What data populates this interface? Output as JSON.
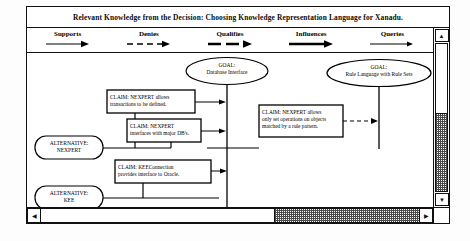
{
  "window": {
    "title": "Relevant Knowledge from the Decision: Choosing Knowledge Representation Language for Xanadu."
  },
  "legend": {
    "items": [
      {
        "label": "Supports",
        "style": "thin-solid-arrow",
        "icon": "arrow-right-icon"
      },
      {
        "label": "Denies",
        "style": "thin-dashed-arrow",
        "icon": "arrow-right-dashed-icon"
      },
      {
        "label": "Qualifies",
        "style": "thick-dashed-arrow",
        "icon": "arrow-right-thick-dashed-icon"
      },
      {
        "label": "Influences",
        "style": "thick-solid-arrow",
        "icon": "arrow-right-thick-icon"
      },
      {
        "label": "Queries",
        "style": "thin-solid-arrow",
        "icon": "arrow-right-small-icon"
      }
    ]
  },
  "graph": {
    "goals": [
      {
        "id": "goal-database-interface",
        "line1": "GOAL:",
        "line2": "Database Interface"
      },
      {
        "id": "goal-rule-language",
        "line1": "GOAL:",
        "line2": "Rule Language with Rule Sets"
      }
    ],
    "alternatives": [
      {
        "id": "alternative-nexpert",
        "line1": "ALTERNATIVE:",
        "line2": "NEXPERT"
      },
      {
        "id": "alternative-kee",
        "line1": "ALTERNATIVE:",
        "line2": "KEE"
      }
    ],
    "claims": [
      {
        "id": "claim-nexpert-transactions",
        "lines": [
          "CLAIM:  NEXPERT allows",
          "transactions to be defined."
        ]
      },
      {
        "id": "claim-nexpert-interfaces",
        "lines": [
          "CLAIM:  NEXPERT",
          "interfaces with major DB's."
        ]
      },
      {
        "id": "claim-nexpert-set-operations",
        "lines": [
          "CLAIM:  NEXPERT allows",
          "only set operations on objects",
          "matched by a rule pattern."
        ]
      },
      {
        "id": "claim-keeconnection-oracle",
        "lines": [
          "CLAIM: KEEConnection",
          "provides interface to Oracle."
        ]
      }
    ]
  },
  "colors": {
    "ink": "#000000",
    "frame": "#111111",
    "canvas": "#ffffff",
    "scroll_trough": "#4a4a4a"
  }
}
